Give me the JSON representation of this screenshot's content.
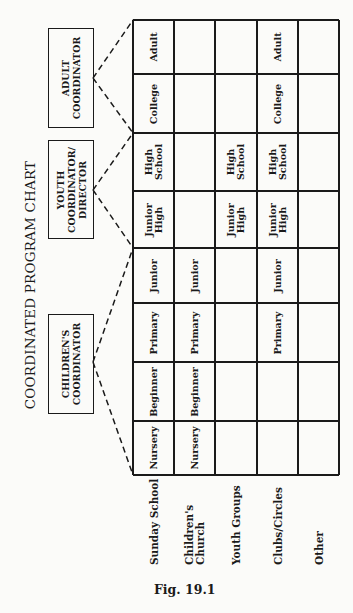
{
  "title": "COORDINATED PROGRAM CHART",
  "caption": "Fig. 19.1",
  "coordinators": [
    {
      "id": "adult",
      "label": "ADULT\nCOORDINATOR",
      "lines": [
        "ADULT",
        "COORDINATOR"
      ]
    },
    {
      "id": "youth",
      "label": "YOUTH\nCOORDINATOR/\nDIRECTOR",
      "lines": [
        "YOUTH",
        "COORDINATOR/",
        "DIRECTOR"
      ]
    },
    {
      "id": "children",
      "label": "CHILDREN'S\nCOORDINATOR",
      "lines": [
        "CHILDREN'S",
        "COORDINATOR"
      ]
    }
  ],
  "age_groups": [
    "Nursery",
    "Beginner",
    "Primary",
    "Junior",
    "Junior High",
    "High School",
    "College",
    "Adult"
  ],
  "programs": [
    {
      "name": "Sunday School",
      "lines": [
        "Sunday School"
      ],
      "cells": [
        "Nursery",
        "Beginner",
        "Primary",
        "Junior",
        "Junior High",
        "High School",
        "College",
        "Adult"
      ]
    },
    {
      "name": "Children's Church",
      "lines": [
        "Children's",
        "Church"
      ],
      "cells": [
        "Nursery",
        "Beginner",
        "Primary",
        "Junior",
        "",
        "",
        "",
        ""
      ]
    },
    {
      "name": "Youth Groups",
      "lines": [
        "Youth Groups"
      ],
      "cells": [
        "",
        "",
        "",
        "",
        "Junior High",
        "High School",
        "",
        ""
      ]
    },
    {
      "name": "Clubs/Circles",
      "lines": [
        "Clubs/Circles"
      ],
      "cells": [
        "",
        "",
        "Primary",
        "Junior",
        "Junior High",
        "High School",
        "College",
        "Adult"
      ]
    },
    {
      "name": "Other",
      "lines": [
        "Other"
      ],
      "cells": [
        "",
        "",
        "",
        "",
        "",
        "",
        "",
        ""
      ]
    }
  ],
  "chart_data": {
    "type": "table",
    "title": "COORDINATED PROGRAM CHART",
    "caption": "Fig. 19.1",
    "orientation": "rotated 90deg counter-clockwise",
    "columns": [
      "Nursery",
      "Beginner",
      "Primary",
      "Junior",
      "Junior High",
      "High School",
      "College",
      "Adult"
    ],
    "rows": [
      "Sunday School",
      "Children's Church",
      "Youth Groups",
      "Clubs/Circles",
      "Other"
    ],
    "coordinator_groups": [
      {
        "coordinator": "CHILDREN'S COORDINATOR",
        "covers": [
          "Nursery",
          "Beginner",
          "Primary",
          "Junior"
        ]
      },
      {
        "coordinator": "YOUTH COORDINATOR/DIRECTOR",
        "covers": [
          "Junior High",
          "High School"
        ]
      },
      {
        "coordinator": "ADULT COORDINATOR",
        "covers": [
          "College",
          "Adult"
        ]
      }
    ]
  }
}
